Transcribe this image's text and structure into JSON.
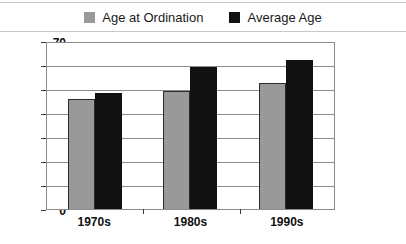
{
  "chart_data": {
    "type": "bar",
    "title": "",
    "xlabel": "",
    "ylabel": "",
    "categories": [
      "1970s",
      "1980s",
      "1990s"
    ],
    "series": [
      {
        "name": "Age at Ordination",
        "color": "#999999",
        "values": [
          46,
          49,
          52.5
        ]
      },
      {
        "name": "Average Age",
        "color": "#111111",
        "values": [
          48.5,
          59,
          62
        ]
      }
    ],
    "ylim": [
      0,
      70
    ],
    "ytick_step": 10,
    "yticks": [
      0,
      10,
      20,
      30,
      40,
      50,
      60,
      70
    ],
    "ytick_labels": [
      "0",
      "10",
      "20",
      "30",
      "40",
      "50",
      "60",
      "70"
    ],
    "grid": true,
    "legend_position": "top-center"
  },
  "legend": {
    "items": [
      {
        "label": "Age at Ordination",
        "swatch": "legend-swatch-gray"
      },
      {
        "label": "Average Age",
        "swatch": "legend-swatch-black"
      }
    ]
  }
}
